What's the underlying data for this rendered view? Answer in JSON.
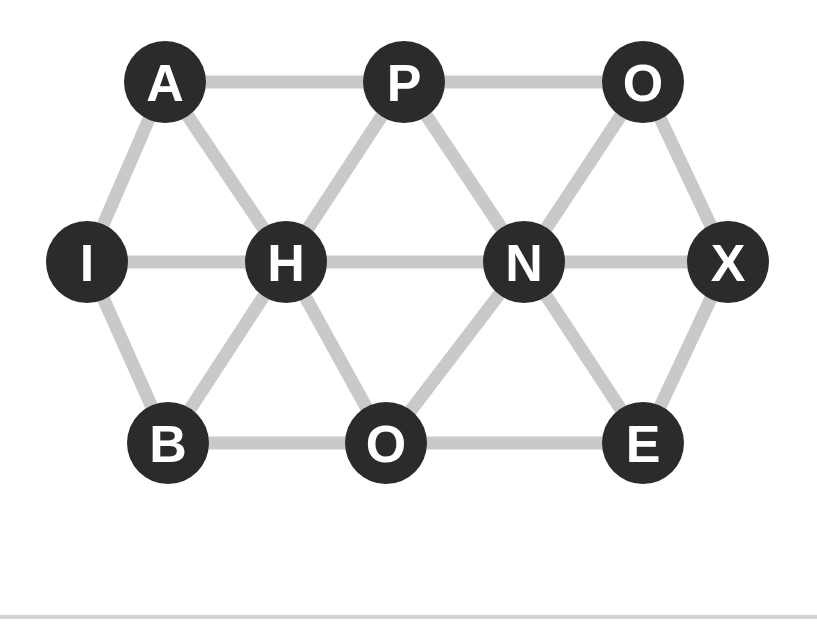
{
  "canvas": {
    "width": 817,
    "height": 625,
    "background": "#ffffff"
  },
  "theme": {
    "node_fill": "#2b2b2b",
    "node_label_color": "#ffffff",
    "edge_color": "#c9c9c9",
    "dash_color": "#2b2b2b",
    "rule_color": "#d2d4d6"
  },
  "puzzle": {
    "type": "letter-graph",
    "node_radius": 41,
    "edge_width": 13,
    "nodes": [
      {
        "id": "n1",
        "label": "A",
        "x": 165,
        "y": 82,
        "row": "top",
        "col": 0
      },
      {
        "id": "n2",
        "label": "P",
        "x": 404,
        "y": 82,
        "row": "top",
        "col": 1
      },
      {
        "id": "n3",
        "label": "O",
        "x": 643,
        "y": 82,
        "row": "top",
        "col": 2
      },
      {
        "id": "n4",
        "label": "I",
        "x": 87,
        "y": 262,
        "row": "middle",
        "col": 0
      },
      {
        "id": "n5",
        "label": "H",
        "x": 286,
        "y": 262,
        "row": "middle",
        "col": 1
      },
      {
        "id": "n6",
        "label": "N",
        "x": 524,
        "y": 262,
        "row": "middle",
        "col": 2
      },
      {
        "id": "n7",
        "label": "X",
        "x": 728,
        "y": 262,
        "row": "middle",
        "col": 3
      },
      {
        "id": "n8",
        "label": "B",
        "x": 168,
        "y": 443,
        "row": "bottom",
        "col": 0
      },
      {
        "id": "n9",
        "label": "O",
        "x": 386,
        "y": 443,
        "row": "bottom",
        "col": 1
      },
      {
        "id": "n10",
        "label": "E",
        "x": 643,
        "y": 443,
        "row": "bottom",
        "col": 2
      }
    ],
    "edges": [
      {
        "from": "n1",
        "to": "n2"
      },
      {
        "from": "n2",
        "to": "n3"
      },
      {
        "from": "n1",
        "to": "n4"
      },
      {
        "from": "n1",
        "to": "n5"
      },
      {
        "from": "n2",
        "to": "n5"
      },
      {
        "from": "n2",
        "to": "n6"
      },
      {
        "from": "n3",
        "to": "n6"
      },
      {
        "from": "n3",
        "to": "n7"
      },
      {
        "from": "n4",
        "to": "n5"
      },
      {
        "from": "n5",
        "to": "n6"
      },
      {
        "from": "n6",
        "to": "n7"
      },
      {
        "from": "n4",
        "to": "n8"
      },
      {
        "from": "n5",
        "to": "n8"
      },
      {
        "from": "n5",
        "to": "n9"
      },
      {
        "from": "n6",
        "to": "n9"
      },
      {
        "from": "n6",
        "to": "n10"
      },
      {
        "from": "n7",
        "to": "n10"
      },
      {
        "from": "n8",
        "to": "n9"
      },
      {
        "from": "n9",
        "to": "n10"
      }
    ]
  },
  "answer": {
    "icon": "pencil-icon",
    "value": "",
    "placeholder": ""
  }
}
